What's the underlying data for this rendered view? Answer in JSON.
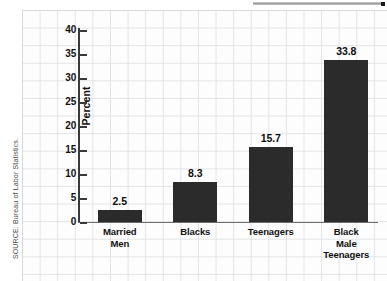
{
  "chart_data": {
    "type": "bar",
    "title": "",
    "subtitle": "",
    "xlabel": "",
    "ylabel": "Percent",
    "ylim": [
      0,
      40
    ],
    "ytick_step": 5,
    "yticks": [
      40,
      35,
      30,
      25,
      20,
      15,
      10,
      5,
      0
    ],
    "grid": true,
    "legend": "none",
    "categories": [
      "Married Men",
      "Blacks",
      "Teenagers",
      "Black Male Teenagers"
    ],
    "category_lines": [
      [
        "Married",
        "Men"
      ],
      [
        "Blacks"
      ],
      [
        "Teenagers"
      ],
      [
        "Black",
        "Male",
        "Teenagers"
      ]
    ],
    "values": [
      2.5,
      8.3,
      15.7,
      33.8
    ],
    "value_labels": [
      "2.5",
      "8.3",
      "15.7",
      "33.8"
    ],
    "bar_color": "#2b2b2b",
    "axis_color": "#3a3a3a",
    "grid_color": "#e2e4e6"
  },
  "source": {
    "credit": "SOURCE: Bureau of Labor Statistics."
  },
  "artifacts": {
    "top_rule": ""
  }
}
